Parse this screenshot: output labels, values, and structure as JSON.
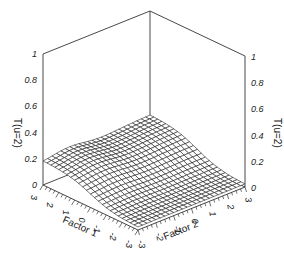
{
  "chart_data": {
    "type": "surface3d",
    "title": "",
    "xlabel": "Factor 1",
    "ylabel": "Factor 2",
    "zlabel_left": "T(u=2)",
    "zlabel_right": "T(u=2)",
    "x_range": [
      -3,
      3
    ],
    "y_range": [
      -3,
      3
    ],
    "zlim": [
      0,
      1
    ],
    "x_ticks": [
      3,
      2,
      1,
      0,
      -1,
      -2,
      -3
    ],
    "x_tick_labels": [
      "3",
      "2",
      "1",
      "0",
      "-1",
      "-2",
      "-3"
    ],
    "y_ticks": [
      -3,
      -2,
      -1,
      0,
      1,
      2,
      3
    ],
    "y_tick_labels": [
      "-3",
      "-2",
      "-1",
      "0",
      "1",
      "2",
      "3"
    ],
    "z_ticks": [
      0,
      0.2,
      0.4,
      0.6,
      0.8,
      1
    ],
    "z_tick_labels": [
      "0",
      "0.2",
      "0.4",
      "0.6",
      "0.8",
      "1"
    ],
    "grid_divisions": 24,
    "surface_description": "Wireframe surface; highest (~0.2) along Factor 1 = 3 edge, decreasing toward ~0 at Factor 1 = -3",
    "corner_values": {
      "f1_3_f2_-3": 0.18,
      "f1_3_f2_3": 0.21,
      "f1_-3_f2_-3": 0.02,
      "f1_-3_f2_3": 0.02
    },
    "line_color": "#000000",
    "background": "#ffffff"
  }
}
